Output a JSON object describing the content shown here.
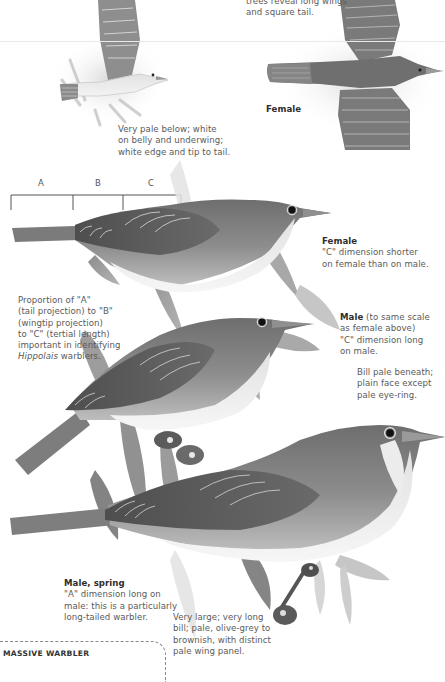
{
  "page": {
    "palette": {
      "background": "#ffffff",
      "text": "#5a5a5a",
      "heading": "#2e2e2e",
      "bird_dark": "#5c5c5c",
      "bird_mid": "#8a8a8a",
      "bird_light": "#e8e8e8",
      "divider": "#e9e9e9"
    }
  },
  "captions": {
    "flight_top_line1": "trees reveal long wings",
    "flight_top_line2": "and square tail.",
    "flight_underside_line1": "Very pale below; white",
    "flight_underside_line2": "on belly and underwing;",
    "flight_underside_line3": "white edge and tip to tail.",
    "flight_female_label": "Female",
    "perched_female_label": "Female",
    "perched_female_line1": "\"C\" dimension shorter",
    "perched_female_line2": "on female than on male.",
    "proportion_line1": "Proportion of \"A\"",
    "proportion_line2": "(tail projection) to \"B\"",
    "proportion_line3": "(wingtip projection)",
    "proportion_line4": "to \"C\" (tertial length)",
    "proportion_line5": "important in identifying",
    "proportion_genus": "Hippolais",
    "proportion_line6_rest": " warblers.",
    "male_label": "Male",
    "male_line1_rest": " (to same scale",
    "male_line2": "as female above)",
    "male_line3": "\"C\" dimension long",
    "male_line4": "on male.",
    "bill_line1": "Bill pale beneath;",
    "bill_line2": "plain face except",
    "bill_line3": "pale eye-ring.",
    "spring_label": "Male, spring",
    "spring_line1": "\"A\" dimension long on",
    "spring_line2": "male: this is a particularly",
    "spring_line3": "long-tailed warbler.",
    "large_line1": "Very large; very long",
    "large_line2": "bill; pale, olive-grey to",
    "large_line3": "brownish, with distinct",
    "large_line4": "pale wing panel."
  },
  "brackets": {
    "labels": [
      "A",
      "B",
      "C"
    ]
  },
  "box": {
    "title": "MASSIVE WARBLER"
  }
}
